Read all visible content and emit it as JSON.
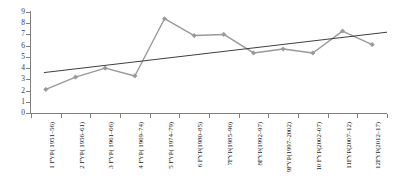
{
  "chart_data": {
    "type": "line",
    "title": "",
    "subtitle": "",
    "xlabel": "",
    "ylabel": "",
    "ylim": [
      0,
      9
    ],
    "grid": false,
    "legend": "none",
    "y_ticks": [
      "0",
      "1",
      "2",
      "3",
      "4",
      "5",
      "6",
      "7",
      "8",
      "9"
    ],
    "categories": [
      "1 FYP( 1951–56)",
      "2 FYP( 1956–61)",
      "3 FYP( 1961–66)",
      "4 FYP( 1969–74)",
      "5 FYP( 1974–79)",
      "6 FYP(1980–85)",
      "7FYP(1985–90)",
      "8FYP(1992–97)",
      "9FYP(1997–2002)",
      "10 FYP(2002–07)",
      "11FYP(2007–12)",
      "12FYP(2012–17)"
    ],
    "series": [
      {
        "name": "Growth rate",
        "color": "#999999",
        "marker": "diamond",
        "values": [
          2.1,
          3.2,
          4.0,
          3.3,
          8.4,
          6.9,
          7.0,
          5.35,
          5.7,
          5.35,
          7.3,
          6.1
        ]
      }
    ],
    "trendline": {
      "name": "Linear trend",
      "color": "#3f3f3f",
      "start_value": 3.6,
      "end_value": 7.2
    }
  }
}
